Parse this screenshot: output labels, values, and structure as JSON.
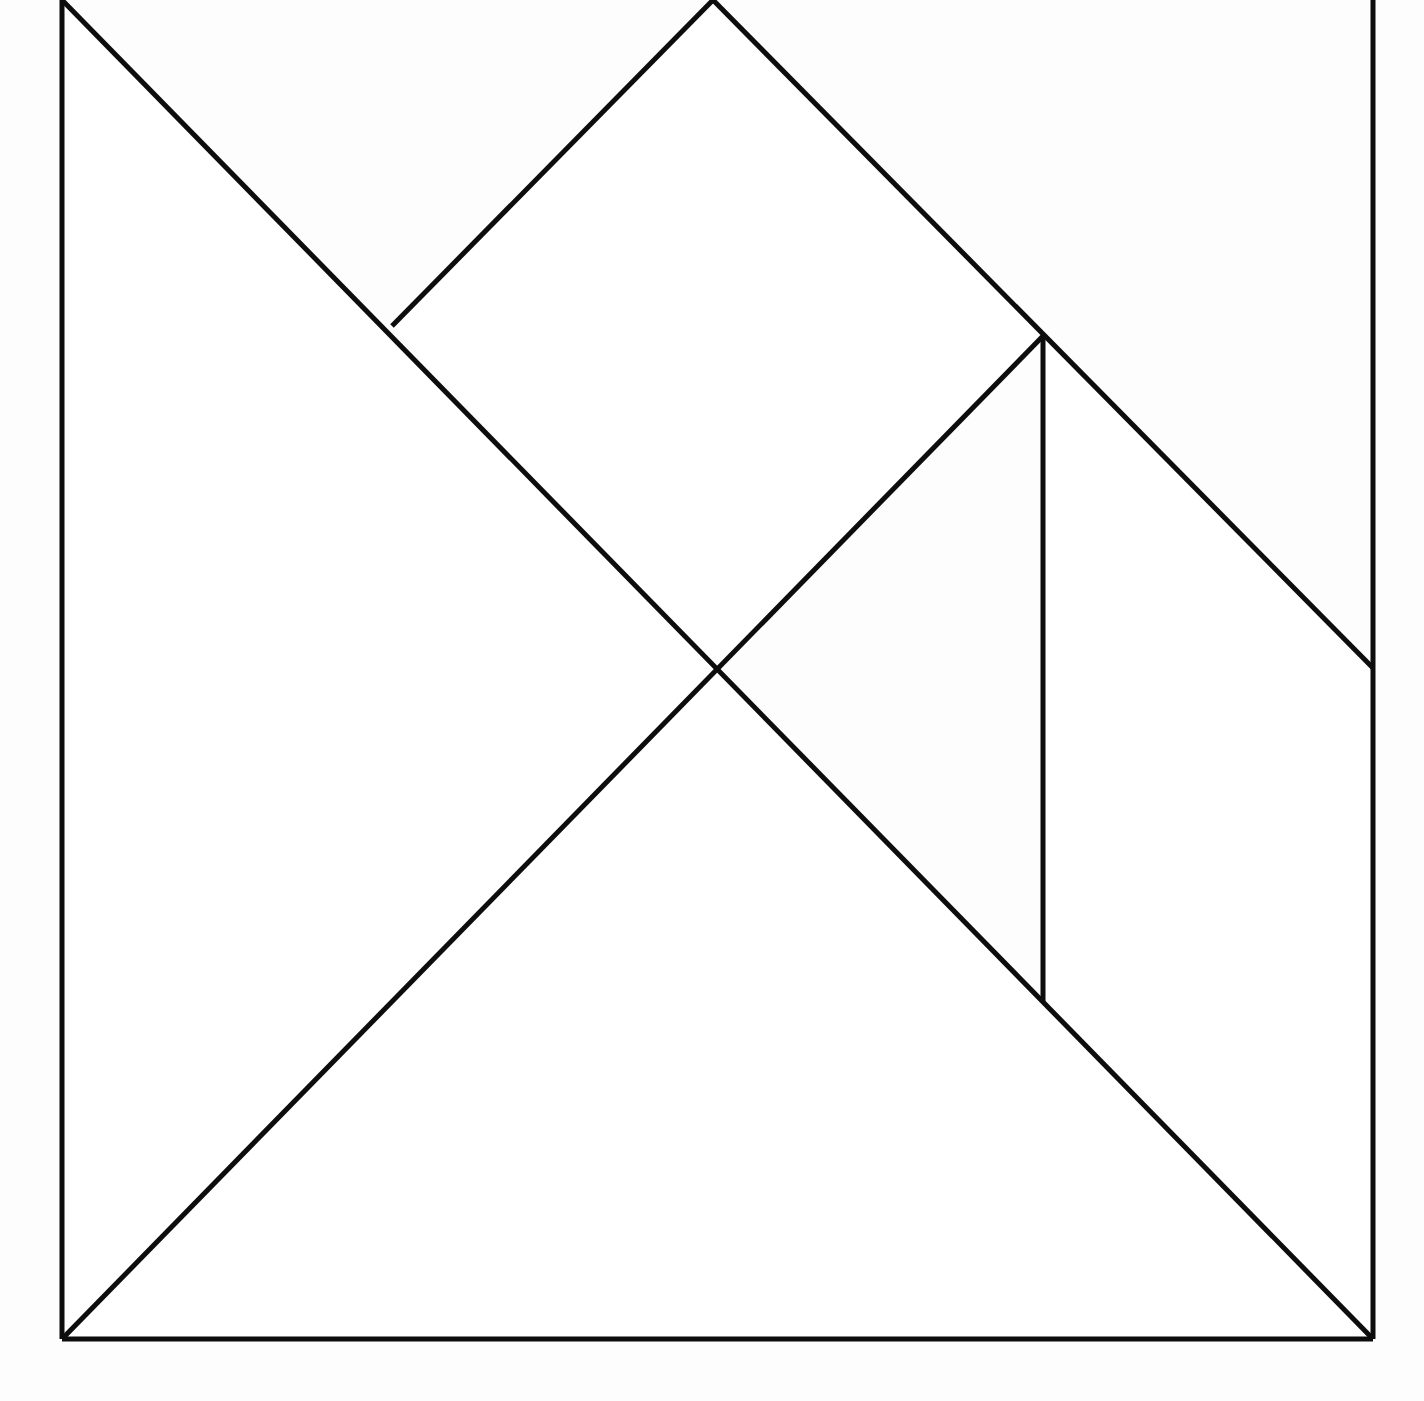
{
  "figure": {
    "background_color": "#fdfdfd",
    "line_color": "#0d0d0d",
    "fill_color": "#ffffff",
    "line_width": 5,
    "canvas": {
      "width": 1424,
      "height": 1401
    },
    "square": {
      "left": 62,
      "right": 1373,
      "top": 0,
      "bottom": 1339,
      "note": "top edge is cropped off the top of the image"
    },
    "vertices": [
      {
        "name": "top-left-corner",
        "x": 62,
        "y": 0
      },
      {
        "name": "top-mid-apex",
        "x": 713,
        "y": 0
      },
      {
        "name": "top-right-corner",
        "x": 1373,
        "y": 0
      },
      {
        "name": "left-upper-node",
        "x": 392,
        "y": 326
      },
      {
        "name": "right-upper-node",
        "x": 1043,
        "y": 336
      },
      {
        "name": "center-crossing",
        "x": 714,
        "y": 668
      },
      {
        "name": "right-edge-midpoint",
        "x": 1373,
        "y": 668
      },
      {
        "name": "vertical-foot",
        "x": 1043,
        "y": 1002
      },
      {
        "name": "bottom-left-corner",
        "x": 62,
        "y": 1339
      },
      {
        "name": "bottom-right-corner",
        "x": 1373,
        "y": 1339
      }
    ],
    "outline_segments": [
      {
        "name": "left-edge",
        "x1": 62,
        "y1": 0,
        "x2": 62,
        "y2": 1339
      },
      {
        "name": "bottom-edge",
        "x1": 62,
        "y1": 1339,
        "x2": 1373,
        "y2": 1339
      },
      {
        "name": "right-edge",
        "x1": 1373,
        "y1": 0,
        "x2": 1373,
        "y2": 1339
      }
    ],
    "cut_segments": [
      {
        "name": "main-diagonal-tl-br",
        "x1": 62,
        "y1": 0,
        "x2": 1373,
        "y2": 1339
      },
      {
        "name": "apex-to-left-node",
        "x1": 713,
        "y1": 0,
        "x2": 392,
        "y2": 326
      },
      {
        "name": "apex-to-right-edge",
        "x1": 713,
        "y1": 0,
        "x2": 1373,
        "y2": 668
      },
      {
        "name": "right-node-to-bottom-left",
        "x1": 1043,
        "y1": 336,
        "x2": 62,
        "y2": 1339
      },
      {
        "name": "vertical-cut",
        "x1": 1043,
        "y1": 336,
        "x2": 1043,
        "y2": 1002
      }
    ],
    "pieces": [
      {
        "name": "large-triangle-left",
        "points": "62,0 714,668 62,1339"
      },
      {
        "name": "large-triangle-bottom",
        "points": "62,1339 714,668 1043,1002 1373,1339"
      },
      {
        "name": "medium-triangle-top",
        "points": "392,326 713,0 1043,336 714,668"
      },
      {
        "name": "small-triangle-right",
        "points": "1043,336 1373,668 1373,1339 1043,1002"
      }
    ]
  }
}
